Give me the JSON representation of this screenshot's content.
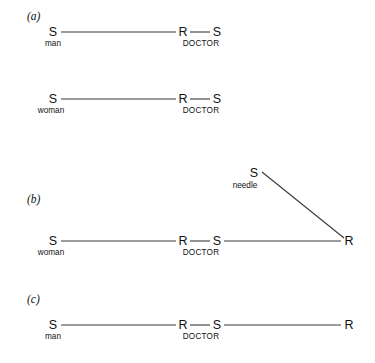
{
  "figure": {
    "caption_present": false,
    "background_color": "#ffffff",
    "line_color": "#3a3a3a",
    "text_color": "#111111"
  },
  "panels": [
    {
      "id": "a",
      "label": "(a)",
      "rows": [
        {
          "id": "a1",
          "nodes": [
            {
              "symbol": "S",
              "role": "man"
            },
            {
              "symbol": "R",
              "role": "DOCTOR"
            },
            {
              "symbol": "S",
              "role": ""
            }
          ]
        },
        {
          "id": "a2",
          "nodes": [
            {
              "symbol": "S",
              "role": "woman"
            },
            {
              "symbol": "R",
              "role": "DOCTOR"
            },
            {
              "symbol": "S",
              "role": ""
            }
          ]
        }
      ]
    },
    {
      "id": "b",
      "label": "(b)",
      "rows": [
        {
          "id": "b1",
          "nodes": [
            {
              "symbol": "S",
              "role": "woman"
            },
            {
              "symbol": "R",
              "role": "DOCTOR"
            },
            {
              "symbol": "S",
              "role": ""
            },
            {
              "symbol": "R",
              "role": ""
            }
          ]
        }
      ],
      "branch": {
        "symbol": "S",
        "role": "needle"
      }
    },
    {
      "id": "c",
      "label": "(c)",
      "rows": [
        {
          "id": "c1",
          "nodes": [
            {
              "symbol": "S",
              "role": "man"
            },
            {
              "symbol": "R",
              "role": "DOCTOR"
            },
            {
              "symbol": "S",
              "role": ""
            },
            {
              "symbol": "R",
              "role": ""
            }
          ]
        }
      ]
    }
  ],
  "text": {
    "panel_a": "(a)",
    "panel_b": "(b)",
    "panel_c": "(c)",
    "S": "S",
    "R": "R",
    "man": "man",
    "woman": "woman",
    "doctor": "DOCTOR",
    "needle": "needle"
  }
}
